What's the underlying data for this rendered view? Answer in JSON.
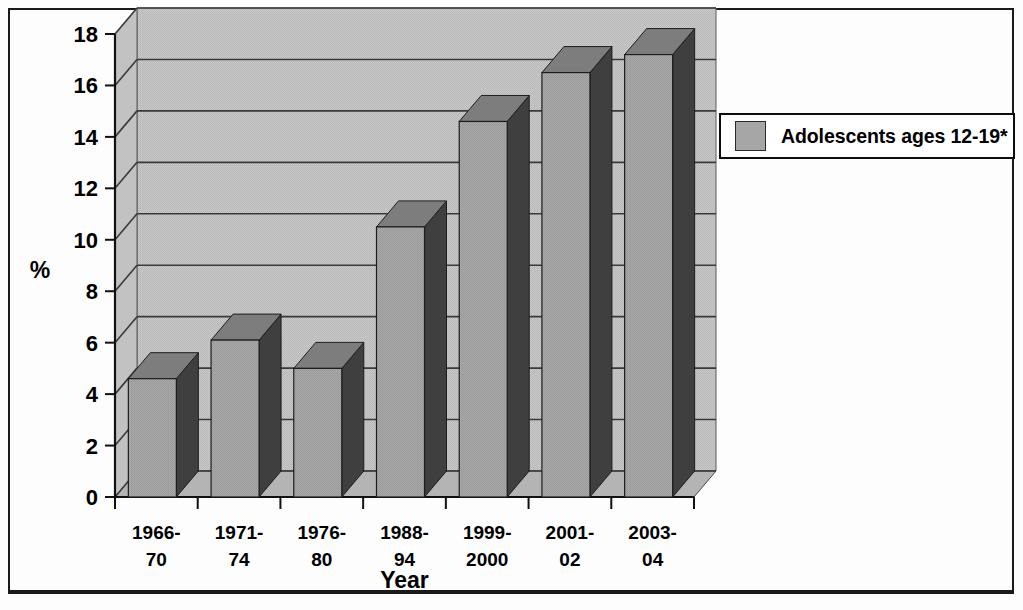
{
  "chart_data": {
    "type": "bar",
    "title": "",
    "subtitle": "",
    "xlabel": "Year",
    "ylabel": "%",
    "categories": [
      "1966-70",
      "1971-74",
      "1976-80",
      "1988-94",
      "1999-2000",
      "2001-02",
      "2003-04"
    ],
    "category_lines": [
      [
        "1966-",
        "70"
      ],
      [
        "1971-",
        "74"
      ],
      [
        "1976-",
        "80"
      ],
      [
        "1988-",
        "94"
      ],
      [
        "1999-",
        "2000"
      ],
      [
        "2001-",
        "02"
      ],
      [
        "2003-",
        "04"
      ]
    ],
    "series": [
      {
        "name": "Adolescents ages 12-19*",
        "values": [
          4.6,
          6.1,
          5.0,
          10.5,
          14.6,
          16.5,
          17.2
        ],
        "color": "#a6a6a6"
      }
    ],
    "values": [
      4.6,
      6.1,
      5.0,
      10.5,
      14.6,
      16.5,
      17.2
    ],
    "ylim": [
      0,
      18
    ],
    "ytick_step": 2,
    "yticks": [
      0,
      2,
      4,
      6,
      8,
      10,
      12,
      14,
      16,
      18
    ],
    "ytick_labels": [
      "0",
      "2",
      "4",
      "6",
      "8",
      "10",
      "12",
      "14",
      "16",
      "18"
    ],
    "grid": true,
    "grid_axis": "y",
    "legend_position": "right",
    "style": "3d-column",
    "plot_bgcolor": "#cfcfcf",
    "bar_color": "#a6a6a6",
    "bar_side_color": "#4a4a4a",
    "bar_top_color": "#808080"
  },
  "legend": {
    "entries": [
      {
        "label": "Adolescents ages 12-19*",
        "swatch_color": "#a6a6a6"
      }
    ]
  },
  "axes": {
    "y_title": "%",
    "x_title": "Year"
  }
}
